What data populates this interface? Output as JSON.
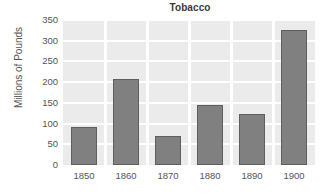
{
  "chart_data": {
    "type": "bar",
    "title": "Tobacco",
    "xlabel": "",
    "ylabel": "Millions of Pounds",
    "categories": [
      "1850",
      "1860",
      "1870",
      "1880",
      "1890",
      "1900"
    ],
    "values": [
      92,
      207,
      71,
      145,
      124,
      327
    ],
    "ylim": [
      0,
      350
    ],
    "yticks": [
      0,
      50,
      100,
      150,
      200,
      250,
      300,
      350
    ],
    "ytick_labels": [
      "0",
      "50",
      "100",
      "150",
      "200",
      "250",
      "300",
      "350"
    ],
    "grid": true,
    "grid_color": "#ffffff",
    "plot_background": "#ebebeb",
    "bar_color": "#808080",
    "bar_edge_color": "#5e5e5e",
    "legend": null,
    "legend_position": "none",
    "series": [
      {
        "name": "Tobacco",
        "values": [
          92,
          207,
          71,
          145,
          124,
          327
        ]
      }
    ]
  }
}
